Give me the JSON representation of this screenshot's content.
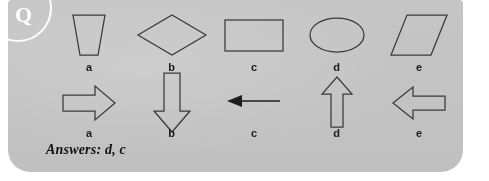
{
  "card": {
    "background_color": "#c3c3c3",
    "badge": {
      "letter": "Q",
      "color": "#ffffff"
    }
  },
  "rows": [
    {
      "name": "shapes-row",
      "items": [
        {
          "label": "a",
          "icon": "trapezoid-shape"
        },
        {
          "label": "b",
          "icon": "diamond-shape"
        },
        {
          "label": "c",
          "icon": "rectangle-shape"
        },
        {
          "label": "d",
          "icon": "ellipse-shape"
        },
        {
          "label": "e",
          "icon": "parallelogram-shape"
        }
      ]
    },
    {
      "name": "arrows-row",
      "items": [
        {
          "label": "a",
          "icon": "block-arrow-right-icon"
        },
        {
          "label": "b",
          "icon": "block-arrow-down-icon"
        },
        {
          "label": "c",
          "icon": "line-arrow-left-icon"
        },
        {
          "label": "d",
          "icon": "block-arrow-up-icon"
        },
        {
          "label": "e",
          "icon": "block-arrow-left-icon"
        }
      ]
    }
  ],
  "answers": {
    "text": "Answers: d, c"
  }
}
